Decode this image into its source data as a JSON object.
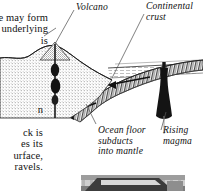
{
  "figure": {
    "background_color": "#ffffff",
    "ink_color": "#111111"
  },
  "body_text": {
    "top_left": "le may form\ne underlying\nis",
    "bottom_left": "n\n\nck is\nes its\nurface,\nravels."
  },
  "callouts": {
    "volcano": "Volcano",
    "continental_crust": "Continental\ncrust",
    "ocean_floor": "Ocean floor\nsubducts\ninto mantle",
    "rising_magma": "Rising\nmagma"
  },
  "icons": {
    "leader_line": "leader-line-icon",
    "flow_arrow": "flow-arrow-icon",
    "magma_plume": "magma-plume-icon",
    "volcano_cone": "volcano-cone-icon"
  }
}
